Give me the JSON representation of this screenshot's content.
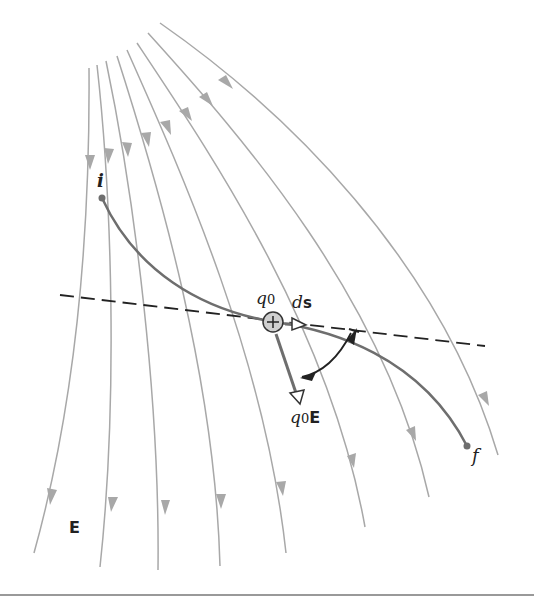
{
  "figure": {
    "labels": {
      "initial_point": "i",
      "final_point": "f",
      "charge": "q0",
      "charge_sub": "0",
      "charge_base": "q",
      "displacement_d": "d",
      "displacement_s": "s",
      "force_q": "q",
      "force_sub": "0",
      "force_E": "E",
      "field": "E",
      "charge_sign": "+"
    },
    "colors": {
      "field_line": "#a8a8a8",
      "path": "#6e6e6e",
      "dashed_tangent": "#222222",
      "charge_fill": "#cfcfcf",
      "rule": "#777777"
    },
    "field_line_count": 8
  }
}
